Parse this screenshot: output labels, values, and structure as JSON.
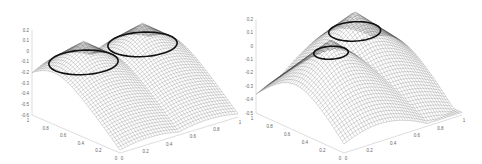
{
  "chart_data": [
    {
      "type": "surface",
      "title": "",
      "description": "3D mesh surface with two conical peaks, each encircled by a dark level-set contour ring; surface drops steeply toward the front corner",
      "xlabel": "",
      "ylabel": "",
      "zlabel": "",
      "x_ticks": [
        "0",
        "0.2",
        "0.4",
        "0.6",
        "0.8",
        "1"
      ],
      "y_ticks": [
        "0",
        "0.2",
        "0.4",
        "0.6",
        "0.8",
        "1"
      ],
      "z_ticks": [
        "0.2",
        "0.1",
        "0",
        "-0.1",
        "-0.2",
        "-0.3",
        "-0.4",
        "-0.5",
        "-0.6"
      ],
      "xlim": [
        0,
        1
      ],
      "ylim": [
        0,
        1
      ],
      "zlim": [
        -0.6,
        0.2
      ],
      "peaks": [
        {
          "x": 0.25,
          "y": 0.75,
          "z": 0.1
        },
        {
          "x": 0.75,
          "y": 0.75,
          "z": 0.1
        }
      ],
      "contour_level": -0.1,
      "grid": false
    },
    {
      "type": "surface",
      "title": "",
      "description": "3D mesh surface with two conical peaks placed more centrally, each encircled by a dark level-set contour ring; broader ridge between peaks",
      "xlabel": "",
      "ylabel": "",
      "zlabel": "",
      "x_ticks": [
        "0",
        "0.2",
        "0.4",
        "0.6",
        "0.8",
        "1"
      ],
      "y_ticks": [
        "0",
        "0.2",
        "0.4",
        "0.6",
        "0.8",
        "1"
      ],
      "z_ticks": [
        "0.2",
        "0.1",
        "0",
        "-0.1",
        "-0.2",
        "-0.3",
        "-0.4",
        "-0.5"
      ],
      "xlim": [
        0,
        1
      ],
      "ylim": [
        0,
        1
      ],
      "zlim": [
        -0.5,
        0.2
      ],
      "peaks": [
        {
          "x": 0.3,
          "y": 0.55,
          "z": 0.1
        },
        {
          "x": 0.65,
          "y": 0.75,
          "z": 0.15
        }
      ],
      "contour_level": 0.0,
      "grid": false
    }
  ]
}
